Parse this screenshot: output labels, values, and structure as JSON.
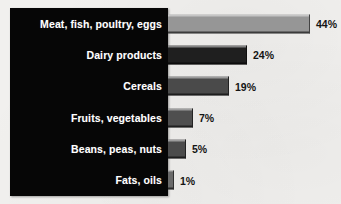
{
  "chart_data": {
    "type": "bar",
    "orientation": "horizontal",
    "title": "",
    "subtitle": "",
    "xlabel": "",
    "ylabel": "",
    "xlim": [
      0,
      50
    ],
    "grid": false,
    "legend": null,
    "value_suffix": "%",
    "categories": [
      "Meat, fish, poultry, eggs",
      "Dairy products",
      "Cereals",
      "Fruits, vegetables",
      "Beans, peas, nuts",
      "Fats, oils"
    ],
    "values": [
      44,
      24,
      19,
      7,
      5,
      1
    ],
    "value_labels": [
      "44%",
      "24%",
      "19%",
      "7%",
      "5%",
      "1%"
    ],
    "bar_colors": [
      "#969696",
      "#1f1f1f",
      "#4a4a4a",
      "#4f4f4f",
      "#4b4b4b",
      "#6a6a6a"
    ]
  },
  "style": {
    "background": "#f1f0ee",
    "panel_background": "#060606",
    "label_color": "#ffffff",
    "value_color": "#141414"
  },
  "rows": [
    {
      "label": "Meat, fish, poultry, eggs",
      "value_label": "44%",
      "bar_px": 142,
      "color": "#969696"
    },
    {
      "label": "Dairy products",
      "value_label": "24%",
      "bar_px": 79,
      "color": "#1f1f1f"
    },
    {
      "label": "Cereals",
      "value_label": "19%",
      "bar_px": 61,
      "color": "#4a4a4a"
    },
    {
      "label": "Fruits, vegetables",
      "value_label": "7%",
      "bar_px": 25,
      "color": "#4f4f4f"
    },
    {
      "label": "Beans, peas, nuts",
      "value_label": "5%",
      "bar_px": 18,
      "color": "#4b4b4b"
    },
    {
      "label": "Fats, oils",
      "value_label": "1%",
      "bar_px": 6,
      "color": "#6a6a6a"
    }
  ]
}
